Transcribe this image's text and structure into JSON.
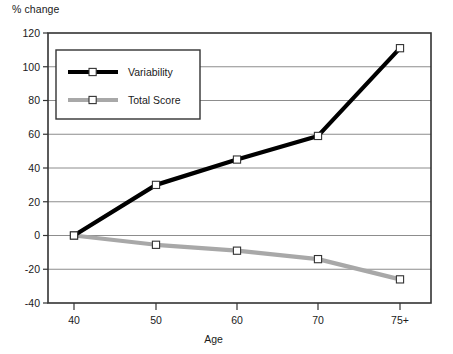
{
  "chart_data": {
    "type": "line",
    "title": "",
    "xlabel": "Age",
    "ylabel": "% change",
    "categories": [
      "40",
      "50",
      "60",
      "70",
      "75+"
    ],
    "x": [
      40,
      50,
      60,
      70,
      75
    ],
    "series": [
      {
        "name": "Variability",
        "color": "#000000",
        "marker": "open-square",
        "values": [
          0,
          30,
          45,
          59,
          111
        ]
      },
      {
        "name": "Total Score",
        "color": "#a8a8a8",
        "marker": "open-square",
        "values": [
          0,
          -5.5,
          -9,
          -14,
          -26
        ]
      }
    ],
    "ylim": [
      -40,
      120
    ],
    "yticks": [
      -40,
      -20,
      0,
      20,
      40,
      60,
      80,
      100,
      120
    ],
    "ytick_labels": [
      "-40",
      "-20",
      "0",
      "20",
      "40",
      "60",
      "80",
      "100",
      "120"
    ],
    "xtick_labels": [
      "40",
      "50",
      "60",
      "70",
      "75+"
    ],
    "grid": "horizontal",
    "grid_color": "#808080",
    "frame_color": "#333333",
    "legend_position": "upper-left-inside",
    "legend_entries": [
      "Variability",
      "Total Score"
    ]
  },
  "labels": {
    "y_axis_title": "% change",
    "x_axis_title": "Age"
  }
}
